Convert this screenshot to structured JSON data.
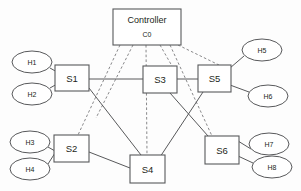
{
  "diagram": {
    "colors": {
      "background": "#fdfdfd",
      "node_stroke": "#58595b",
      "node_fill": "#ffffff",
      "solid_link": "#58595b",
      "dashed_link": "#7a7b7d",
      "text": "#231f20"
    },
    "controller": {
      "name": "controller-node",
      "title": "Controller",
      "id": "C0",
      "x": 113,
      "y": 9,
      "w": 68,
      "h": 36
    },
    "switches": [
      {
        "name": "switch-s1",
        "label": "S1",
        "x": 55,
        "y": 65,
        "w": 34,
        "h": 26
      },
      {
        "name": "switch-s2",
        "label": "S2",
        "x": 54,
        "y": 135,
        "w": 35,
        "h": 27
      },
      {
        "name": "switch-s3",
        "label": "S3",
        "x": 143,
        "y": 66,
        "w": 34,
        "h": 27
      },
      {
        "name": "switch-s4",
        "label": "S4",
        "x": 130,
        "y": 155,
        "w": 35,
        "h": 28
      },
      {
        "name": "switch-s5",
        "label": "S5",
        "x": 198,
        "y": 65,
        "w": 33,
        "h": 27
      },
      {
        "name": "switch-s6",
        "label": "S6",
        "x": 205,
        "y": 136,
        "w": 34,
        "h": 28
      }
    ],
    "hosts": [
      {
        "name": "host-h1",
        "label": "H1",
        "cx": 32,
        "cy": 62,
        "rx": 20,
        "ry": 11
      },
      {
        "name": "host-h2",
        "label": "H2",
        "cx": 32,
        "cy": 94,
        "rx": 20,
        "ry": 11
      },
      {
        "name": "host-h3",
        "label": "H3",
        "cx": 30,
        "cy": 142,
        "rx": 20,
        "ry": 11
      },
      {
        "name": "host-h4",
        "label": "H4",
        "cx": 30,
        "cy": 169,
        "rx": 20,
        "ry": 11
      },
      {
        "name": "host-h5",
        "label": "H5",
        "cx": 262,
        "cy": 50,
        "rx": 20,
        "ry": 11
      },
      {
        "name": "host-h6",
        "label": "H6",
        "cx": 268,
        "cy": 96,
        "rx": 20,
        "ry": 11
      },
      {
        "name": "host-h7",
        "label": "H7",
        "cx": 269,
        "cy": 144,
        "rx": 20,
        "ry": 11
      },
      {
        "name": "host-h8",
        "label": "H8",
        "cx": 272,
        "cy": 167,
        "rx": 20,
        "ry": 11
      }
    ],
    "control_links": [
      {
        "name": "control-link-c0-s2",
        "from": "C0",
        "to": "S2",
        "x1": 120,
        "y1": 45,
        "x2": 78,
        "y2": 135
      },
      {
        "name": "control-link-c0-s1",
        "from": "C0",
        "to": "S1",
        "x1": 133,
        "y1": 45,
        "x2": 96,
        "y2": 118
      },
      {
        "name": "control-link-c0-s4",
        "from": "C0",
        "to": "S4",
        "x1": 146,
        "y1": 45,
        "x2": 147,
        "y2": 155
      },
      {
        "name": "control-link-c0-s3",
        "from": "C0",
        "to": "S3",
        "x1": 160,
        "y1": 45,
        "x2": 172,
        "y2": 66
      },
      {
        "name": "control-link-c0-s6",
        "from": "C0",
        "to": "S6",
        "x1": 170,
        "y1": 45,
        "x2": 212,
        "y2": 136
      },
      {
        "name": "control-link-c0-s5",
        "from": "C0",
        "to": "S5",
        "x1": 178,
        "y1": 45,
        "x2": 219,
        "y2": 65
      }
    ],
    "data_links": [
      {
        "name": "data-link-s1-s3",
        "from": "S1",
        "to": "S3",
        "x1": 89,
        "y1": 79,
        "x2": 143,
        "y2": 79
      },
      {
        "name": "data-link-s3-s5",
        "from": "S3",
        "to": "S5",
        "x1": 177,
        "y1": 79,
        "x2": 198,
        "y2": 79
      },
      {
        "name": "data-link-s1-s4",
        "from": "S1",
        "to": "S4",
        "x1": 89,
        "y1": 88,
        "x2": 141,
        "y2": 155
      },
      {
        "name": "data-link-s2-s4",
        "from": "S2",
        "to": "S4",
        "x1": 89,
        "y1": 152,
        "x2": 130,
        "y2": 168
      },
      {
        "name": "data-link-s3-s6",
        "from": "S3",
        "to": "S6",
        "x1": 170,
        "y1": 93,
        "x2": 208,
        "y2": 136
      },
      {
        "name": "data-link-s5-s4",
        "from": "S5",
        "to": "S4",
        "x1": 203,
        "y1": 92,
        "x2": 160,
        "y2": 157
      },
      {
        "name": "host-link-h1-s1",
        "from": "H1",
        "to": "S1",
        "x1": 50,
        "y1": 68,
        "x2": 57,
        "y2": 72
      },
      {
        "name": "host-link-h2-s1",
        "from": "H2",
        "to": "S1",
        "x1": 50,
        "y1": 88,
        "x2": 57,
        "y2": 84
      },
      {
        "name": "host-link-h3-s2",
        "from": "H3",
        "to": "S2",
        "x1": 48,
        "y1": 147,
        "x2": 55,
        "y2": 151
      },
      {
        "name": "host-link-h4-s2",
        "from": "H4",
        "to": "S2",
        "x1": 48,
        "y1": 164,
        "x2": 55,
        "y2": 153
      },
      {
        "name": "host-link-h5-s5",
        "from": "H5",
        "to": "S5",
        "x1": 244,
        "y1": 56,
        "x2": 230,
        "y2": 68
      },
      {
        "name": "host-link-h6-s5",
        "from": "H6",
        "to": "S5",
        "x1": 249,
        "y1": 92,
        "x2": 230,
        "y2": 85
      },
      {
        "name": "host-link-h7-s6",
        "from": "H7",
        "to": "S6",
        "x1": 251,
        "y1": 149,
        "x2": 238,
        "y2": 141
      },
      {
        "name": "host-link-h8-s6",
        "from": "H8",
        "to": "S6",
        "x1": 253,
        "y1": 163,
        "x2": 238,
        "y2": 156
      }
    ]
  }
}
